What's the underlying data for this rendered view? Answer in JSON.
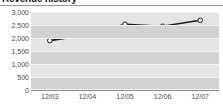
{
  "widget": {
    "title": "Revenue history"
  },
  "chart_data": {
    "type": "line",
    "title": "Revenue history",
    "xlabel": "",
    "ylabel": "",
    "categories": [
      "12/03",
      "12/04",
      "12/05",
      "12/06",
      "12/07"
    ],
    "values": [
      1900,
      2130,
      2530,
      2450,
      2680
    ],
    "series": [
      {
        "name": "Revenue",
        "values": [
          1900,
          2130,
          2530,
          2450,
          2680
        ]
      }
    ],
    "ylim": [
      0,
      3000
    ],
    "yticks": [
      0,
      500,
      1000,
      1500,
      2000,
      2500,
      3000
    ],
    "ytick_labels": [
      "0",
      "500",
      "1,000",
      "1,500",
      "2,000",
      "2,500",
      "3,000"
    ],
    "xtick_labels": [
      "12/03",
      "12/04",
      "12/05",
      "12/06",
      "12/07"
    ],
    "grid": true,
    "legend": "none",
    "marker": "open-circle",
    "colors": {
      "line": "#1c1c1c",
      "marker_fill": "#ffffff",
      "marker_stroke": "#1c1c1c",
      "plot_background": "#e4e4e4",
      "band": "#d2d2d2",
      "gridline": "#f4f4f4",
      "axis_text": "#4a4a4a",
      "title_text": "#1a1a1a"
    }
  }
}
